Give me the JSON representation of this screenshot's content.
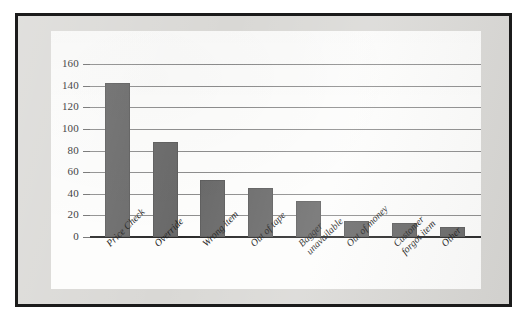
{
  "figure": {
    "panel_background": "#fdfdfc",
    "mat_background": "#d9d8d5",
    "frame_color": "#1b1b1b"
  },
  "chart_data": {
    "type": "bar",
    "title": "",
    "subtitle": "",
    "xlabel": "",
    "ylabel": "",
    "ylim": [
      0,
      160
    ],
    "yticks": [
      0,
      20,
      40,
      60,
      80,
      100,
      120,
      140,
      160
    ],
    "ytick_labels": [
      "0",
      "20",
      "40",
      "60",
      "80",
      "100",
      "120",
      "140",
      "160"
    ],
    "grid": true,
    "grid_axis": "y",
    "legend": false,
    "legend_position": "none",
    "bar_color": "#696969",
    "categories": [
      "Price Check",
      "Override",
      "Wrong item",
      "Out of tape",
      "Bagger unavailable",
      "Out of money",
      "Customer forgot item",
      "Other"
    ],
    "category_lines": [
      [
        "Price Check"
      ],
      [
        "Override"
      ],
      [
        "Wrong item"
      ],
      [
        "Out of tape"
      ],
      [
        "Bagger",
        "unavailable"
      ],
      [
        "Out of money"
      ],
      [
        "Customer",
        "forgot item"
      ],
      [
        "Other"
      ]
    ],
    "values": [
      142,
      88,
      53,
      45,
      33,
      15,
      13,
      9
    ]
  }
}
